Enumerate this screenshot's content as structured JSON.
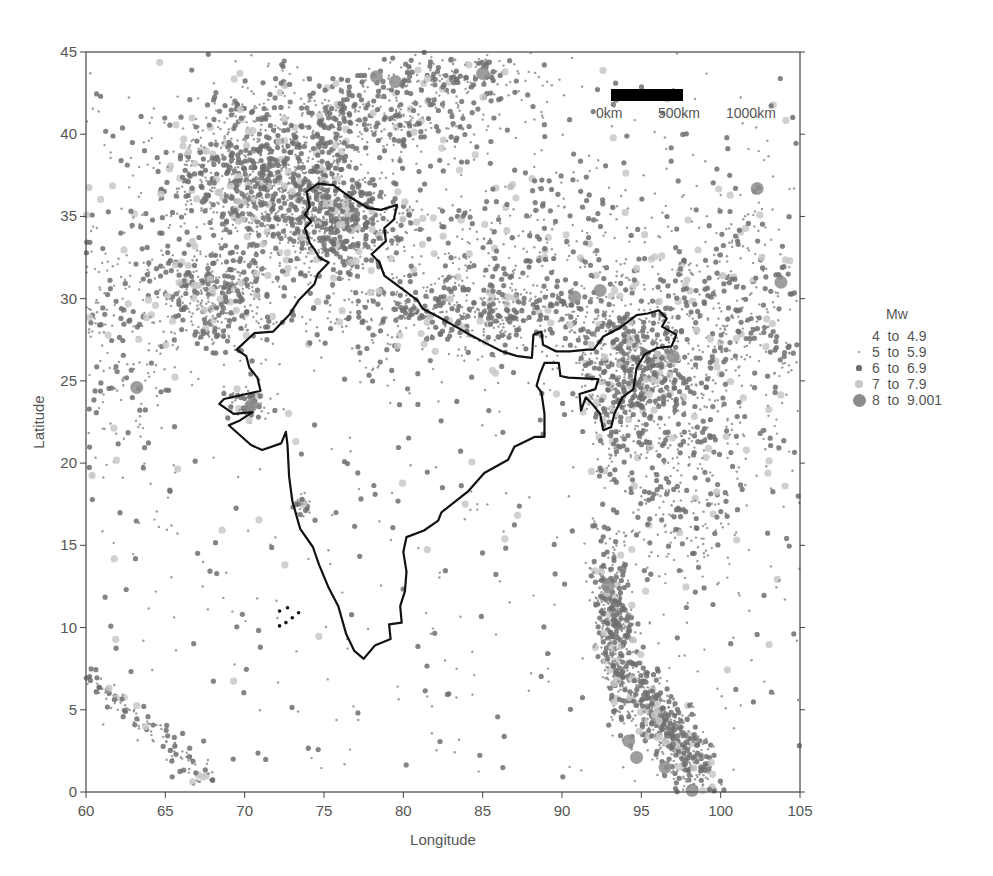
{
  "chart_data": {
    "type": "scatter",
    "title": "",
    "xlabel": "Longitude",
    "ylabel": "Latitude",
    "xlim": [
      60,
      105
    ],
    "ylim": [
      0,
      45
    ],
    "xticks": [
      60,
      65,
      70,
      75,
      80,
      85,
      90,
      95,
      100,
      105
    ],
    "yticks": [
      0,
      5,
      10,
      15,
      20,
      25,
      30,
      35,
      40,
      45
    ],
    "grid": false,
    "legend_position": "right",
    "legend": {
      "title": "Mw",
      "entries": [
        {
          "label_from": "4",
          "label_to": "4.9",
          "size": 0,
          "color": "#999999"
        },
        {
          "label_from": "5",
          "label_to": "5.9",
          "size": 1.2,
          "color": "#8a8a8a"
        },
        {
          "label_from": "6",
          "label_to": "6.9",
          "size": 2.6,
          "color": "#6e6e6e"
        },
        {
          "label_from": "7",
          "label_to": "7.9",
          "size": 3.6,
          "color": "#c8c8c8"
        },
        {
          "label_from": "8",
          "label_to": "9.001",
          "size": 6.5,
          "color": "#8c8c8c"
        }
      ]
    },
    "scale_bar": {
      "labels": [
        "0km",
        "500km",
        "1000km"
      ]
    },
    "series_description": "Earthquake epicentres (Mw 4 to 9) in and around India; dense clusters in Hindu Kush/Pamir, Himalaya arc, NE India/Myanmar, Andaman-Sumatra arc, Makran, Carlsberg ridge",
    "clusters": [
      {
        "name": "Hindu Kush-Pamir",
        "lon": 71.5,
        "lat": 37.0,
        "slon": 3.2,
        "slat": 2.3,
        "n": 1100
      },
      {
        "name": "Tien Shan",
        "lon": 77.5,
        "lat": 41.0,
        "slon": 4.5,
        "slat": 1.3,
        "n": 420
      },
      {
        "name": "N. Tien Shan",
        "lon": 83.5,
        "lat": 43.5,
        "slon": 3.0,
        "slat": 0.8,
        "n": 180
      },
      {
        "name": "Kashmir-Karakoram",
        "lon": 76.0,
        "lat": 34.5,
        "slon": 1.8,
        "slat": 1.5,
        "n": 420
      },
      {
        "name": "Himalayan arc",
        "lon": 84.0,
        "lat": 29.0,
        "slon": 5.5,
        "slat": 1.2,
        "n": 520
      },
      {
        "name": "Tibet",
        "lon": 87.5,
        "lat": 33.0,
        "slon": 6.0,
        "slat": 3.0,
        "n": 500
      },
      {
        "name": "Baluchistan",
        "lon": 68.0,
        "lat": 30.0,
        "slon": 1.8,
        "slat": 1.6,
        "n": 360
      },
      {
        "name": "Iran-Makran",
        "lon": 62.0,
        "lat": 29.0,
        "slon": 2.2,
        "slat": 4.5,
        "n": 280
      },
      {
        "name": "NE India-Myanmar",
        "lon": 94.5,
        "lat": 25.0,
        "slon": 1.8,
        "slat": 2.5,
        "n": 650
      },
      {
        "name": "Yunnan-Sichuan",
        "lon": 100.5,
        "lat": 28.5,
        "slon": 2.8,
        "slat": 4.5,
        "n": 500
      },
      {
        "name": "Myanmar-Thailand",
        "lon": 97.5,
        "lat": 18.0,
        "slon": 2.2,
        "slat": 3.0,
        "n": 260
      },
      {
        "name": "Andaman arc",
        "lon": 93.6,
        "lat": 10.0,
        "slon": 0.9,
        "slat": 3.0,
        "n": 450
      },
      {
        "name": "Sumatra arc",
        "lon": 97.0,
        "lat": 3.5,
        "slon": 1.6,
        "slat": 2.0,
        "n": 550
      },
      {
        "name": "Carlsberg Ridge",
        "lon": 64.0,
        "lat": 4.0,
        "slon": 2.2,
        "slat": 1.4,
        "n": 120
      },
      {
        "name": "Kutch",
        "lon": 70.3,
        "lat": 23.6,
        "slon": 0.7,
        "slat": 0.5,
        "n": 60
      },
      {
        "name": "Koyna",
        "lon": 73.6,
        "lat": 17.4,
        "slon": 0.3,
        "slat": 0.4,
        "n": 25
      },
      {
        "name": "Background",
        "lon": 82.5,
        "lat": 22.5,
        "slon": 13,
        "slat": 13,
        "n": 650
      }
    ],
    "india_outline": [
      [
        74.6,
        37.0
      ],
      [
        75.6,
        36.9
      ],
      [
        76.6,
        36.2
      ],
      [
        77.8,
        35.5
      ],
      [
        78.6,
        35.4
      ],
      [
        79.6,
        35.7
      ],
      [
        79.4,
        34.8
      ],
      [
        78.8,
        34.3
      ],
      [
        78.9,
        33.5
      ],
      [
        78.0,
        32.7
      ],
      [
        78.5,
        32.2
      ],
      [
        78.8,
        31.4
      ],
      [
        79.5,
        30.9
      ],
      [
        80.2,
        30.4
      ],
      [
        80.9,
        29.9
      ],
      [
        81.2,
        29.4
      ],
      [
        82.2,
        28.9
      ],
      [
        83.3,
        28.3
      ],
      [
        84.2,
        27.8
      ],
      [
        85.2,
        27.3
      ],
      [
        86.2,
        26.8
      ],
      [
        87.2,
        26.5
      ],
      [
        88.1,
        26.4
      ],
      [
        88.2,
        27.8
      ],
      [
        88.7,
        28.0
      ],
      [
        88.8,
        27.2
      ],
      [
        89.6,
        26.8
      ],
      [
        90.5,
        26.8
      ],
      [
        91.6,
        26.9
      ],
      [
        92.0,
        26.9
      ],
      [
        92.6,
        27.7
      ],
      [
        93.6,
        28.2
      ],
      [
        94.7,
        29.0
      ],
      [
        95.4,
        29.1
      ],
      [
        96.1,
        29.3
      ],
      [
        96.6,
        28.8
      ],
      [
        96.3,
        28.3
      ],
      [
        97.2,
        27.8
      ],
      [
        96.9,
        27.1
      ],
      [
        96.0,
        27.0
      ],
      [
        95.2,
        26.6
      ],
      [
        94.7,
        25.8
      ],
      [
        94.5,
        24.5
      ],
      [
        93.8,
        24.0
      ],
      [
        93.3,
        23.0
      ],
      [
        93.1,
        22.2
      ],
      [
        92.6,
        22.0
      ],
      [
        92.4,
        23.0
      ],
      [
        91.9,
        23.6
      ],
      [
        91.5,
        24.0
      ],
      [
        91.2,
        23.2
      ],
      [
        91.1,
        24.2
      ],
      [
        92.1,
        24.5
      ],
      [
        92.3,
        25.1
      ],
      [
        90.4,
        25.2
      ],
      [
        89.9,
        25.3
      ],
      [
        89.8,
        26.1
      ],
      [
        88.9,
        26.1
      ],
      [
        88.6,
        25.4
      ],
      [
        88.4,
        24.7
      ],
      [
        88.7,
        24.3
      ],
      [
        88.9,
        23.0
      ],
      [
        88.9,
        21.6
      ],
      [
        88.3,
        21.6
      ],
      [
        87.0,
        21.0
      ],
      [
        86.6,
        20.2
      ],
      [
        85.1,
        19.4
      ],
      [
        84.1,
        18.3
      ],
      [
        82.4,
        17.0
      ],
      [
        82.2,
        16.5
      ],
      [
        81.3,
        15.9
      ],
      [
        80.2,
        15.5
      ],
      [
        80.0,
        14.6
      ],
      [
        80.2,
        13.4
      ],
      [
        80.1,
        12.2
      ],
      [
        79.8,
        11.3
      ],
      [
        79.9,
        10.3
      ],
      [
        79.1,
        10.2
      ],
      [
        79.2,
        9.3
      ],
      [
        78.2,
        8.9
      ],
      [
        77.5,
        8.1
      ],
      [
        76.9,
        8.6
      ],
      [
        76.4,
        9.6
      ],
      [
        75.9,
        11.3
      ],
      [
        75.3,
        12.4
      ],
      [
        74.7,
        13.8
      ],
      [
        74.3,
        14.9
      ],
      [
        73.5,
        16.0
      ],
      [
        73.0,
        17.7
      ],
      [
        72.8,
        19.2
      ],
      [
        72.7,
        21.1
      ],
      [
        72.6,
        21.9
      ],
      [
        72.3,
        21.2
      ],
      [
        71.1,
        20.8
      ],
      [
        70.4,
        21.1
      ],
      [
        69.0,
        22.3
      ],
      [
        69.7,
        22.6
      ],
      [
        70.5,
        23.1
      ],
      [
        69.3,
        23.0
      ],
      [
        68.4,
        23.6
      ],
      [
        68.7,
        23.9
      ],
      [
        71.0,
        24.4
      ],
      [
        70.8,
        25.2
      ],
      [
        70.3,
        25.8
      ],
      [
        70.1,
        26.5
      ],
      [
        69.5,
        26.9
      ],
      [
        70.6,
        27.9
      ],
      [
        71.8,
        28.0
      ],
      [
        72.8,
        29.0
      ],
      [
        73.4,
        29.9
      ],
      [
        74.4,
        30.9
      ],
      [
        74.6,
        31.5
      ],
      [
        75.3,
        32.2
      ],
      [
        74.7,
        32.5
      ],
      [
        74.4,
        33.0
      ],
      [
        74.1,
        33.4
      ],
      [
        73.8,
        34.3
      ],
      [
        74.2,
        34.7
      ],
      [
        73.8,
        35.1
      ],
      [
        74.1,
        35.6
      ],
      [
        73.9,
        36.5
      ],
      [
        74.6,
        37.0
      ]
    ],
    "notable_large_events": [
      {
        "lon": 78.3,
        "lat": 43.5,
        "mw_class": "8 to 9.001"
      },
      {
        "lon": 79.5,
        "lat": 43.2,
        "mw_class": "8 to 9.001"
      },
      {
        "lon": 85.0,
        "lat": 43.7,
        "mw_class": "8 to 9.001"
      },
      {
        "lon": 63.2,
        "lat": 24.6,
        "mw_class": "8 to 9.001"
      },
      {
        "lon": 70.4,
        "lat": 23.5,
        "mw_class": "8 to 9.001"
      },
      {
        "lon": 97.0,
        "lat": 26.5,
        "mw_class": "8 to 9.001"
      },
      {
        "lon": 102.3,
        "lat": 36.7,
        "mw_class": "8 to 9.001"
      },
      {
        "lon": 103.8,
        "lat": 31.0,
        "mw_class": "8 to 9.001"
      },
      {
        "lon": 92.9,
        "lat": 12.5,
        "mw_class": "8 to 9.001"
      },
      {
        "lon": 94.2,
        "lat": 3.1,
        "mw_class": "8 to 9.001"
      },
      {
        "lon": 94.7,
        "lat": 2.1,
        "mw_class": "8 to 9.001"
      },
      {
        "lon": 96.5,
        "lat": 1.5,
        "mw_class": "8 to 9.001"
      },
      {
        "lon": 98.2,
        "lat": 0.1,
        "mw_class": "8 to 9.001"
      },
      {
        "lon": 90.8,
        "lat": 30.1,
        "mw_class": "8 to 9.001"
      },
      {
        "lon": 92.4,
        "lat": 30.5,
        "mw_class": "8 to 9.001"
      }
    ]
  }
}
